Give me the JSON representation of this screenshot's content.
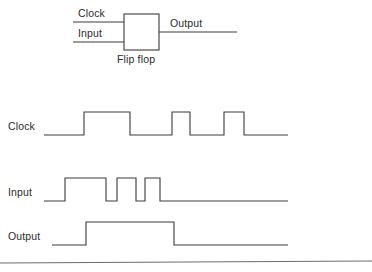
{
  "figure": {
    "background_color": "#ffffff",
    "line_color": "#3a3a3a",
    "width": 372,
    "height": 272
  },
  "block_diagram": {
    "block_label": "Flip flop",
    "inputs": [
      {
        "name": "clock",
        "label": "Clock"
      },
      {
        "name": "input",
        "label": "Input"
      }
    ],
    "outputs": [
      {
        "name": "output",
        "label": "Output"
      }
    ],
    "box": {
      "x": 124,
      "y": 14,
      "width": 35,
      "height": 36
    },
    "clock_wire": {
      "y": 22,
      "x1": 73,
      "x2": 124
    },
    "input_wire": {
      "y": 42,
      "x1": 73,
      "x2": 124
    },
    "output_wire": {
      "y": 32,
      "x1": 159,
      "x2": 237
    }
  },
  "waveforms": [
    {
      "name": "clock",
      "label": "Clock",
      "baseline_y": 135,
      "high_y": 112,
      "x_start": 44,
      "x_end": 288,
      "transitions": [
        84,
        130,
        172,
        190,
        224,
        244
      ],
      "pulses": [
        {
          "rise": 84,
          "fall": 130
        },
        {
          "rise": 172,
          "fall": 190
        },
        {
          "rise": 224,
          "fall": 244
        }
      ],
      "path": "M44,135 L84,135 L84,112 L130,112 L130,135 L172,135 L172,112 L190,112 L190,135 L224,135 L224,112 L244,112 L244,135 L288,135"
    },
    {
      "name": "input",
      "label": "Input",
      "baseline_y": 201,
      "high_y": 178,
      "x_start": 44,
      "x_end": 288,
      "transitions": [
        65,
        106,
        117,
        136,
        145,
        160
      ],
      "pulses": [
        {
          "rise": 65,
          "fall": 106
        },
        {
          "rise": 117,
          "fall": 136
        },
        {
          "rise": 145,
          "fall": 160
        }
      ],
      "path": "M44,201 L65,201 L65,178 L106,178 L106,201 L117,201 L117,178 L136,178 L136,201 L145,201 L145,178 L160,178 L160,201 L288,201"
    },
    {
      "name": "output",
      "label": "Output",
      "baseline_y": 245,
      "high_y": 222,
      "x_start": 52,
      "x_end": 288,
      "transitions": [
        86,
        174
      ],
      "pulses": [
        {
          "rise": 86,
          "fall": 174
        }
      ],
      "path": "M52,245 L86,245 L86,222 L174,222 L174,245 L288,245"
    }
  ],
  "footer_rule": {
    "x1": 0,
    "y1": 263,
    "x2": 372,
    "y2": 261
  }
}
